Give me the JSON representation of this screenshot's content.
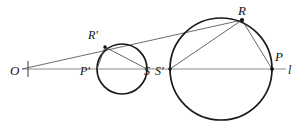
{
  "figure": {
    "canvas": {
      "width": 303,
      "height": 127
    },
    "background_color": "#ffffff",
    "ink_color": "#111111",
    "baseline_color": "#8d8d8d",
    "chord_color": "#4a4a4a"
  },
  "labels": {
    "O": "O",
    "P_prime": "P'",
    "R_prime": "R'",
    "S": "S",
    "S_prime": "S'",
    "R": "R",
    "P": "P",
    "line_l": "l"
  },
  "points": {
    "O": {
      "x": 22,
      "y": 69
    },
    "P_prime": {
      "x": 97,
      "y": 69
    },
    "R_prime": {
      "x": 105,
      "y": 47
    },
    "S": {
      "x": 147,
      "y": 69
    },
    "S_prime": {
      "x": 170,
      "y": 69
    },
    "R": {
      "x": 242,
      "y": 20
    },
    "P": {
      "x": 272,
      "y": 69
    }
  },
  "circles": [
    {
      "name": "small-circle",
      "cx": 122,
      "cy": 69,
      "r": 25
    },
    {
      "name": "large-circle",
      "cx": 221,
      "cy": 69,
      "r": 51
    }
  ],
  "baseline": {
    "name": "line-l",
    "x1": 22,
    "y1": 69,
    "x2": 286,
    "y2": 69
  },
  "segments": [
    {
      "name": "ray-O-R-prime-R",
      "x1": 22,
      "y1": 69,
      "x2": 242,
      "y2": 20
    },
    {
      "name": "chord-P-prime-R-prime",
      "x1": 97,
      "y1": 69,
      "x2": 105,
      "y2": 47
    },
    {
      "name": "chord-R-prime-S",
      "x1": 105,
      "y1": 47,
      "x2": 147,
      "y2": 69
    },
    {
      "name": "chord-S-prime-R",
      "x1": 170,
      "y1": 69,
      "x2": 242,
      "y2": 20
    },
    {
      "name": "chord-R-P",
      "x1": 242,
      "y1": 20,
      "x2": 272,
      "y2": 69
    }
  ],
  "tick": {
    "name": "origin-tick",
    "x": 28,
    "y1": 61,
    "y2": 77
  }
}
